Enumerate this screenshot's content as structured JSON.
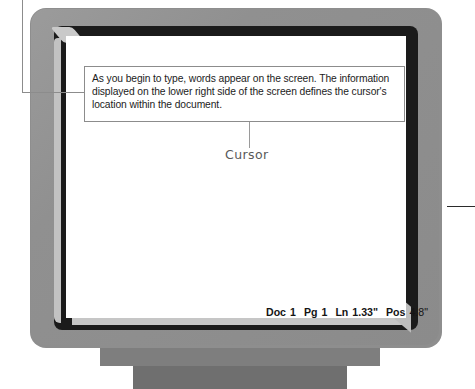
{
  "scene": {
    "title": "CRT monitor illustration with screen callout"
  },
  "callout": {
    "caption": "As you begin to type, words appear on the screen. The information displayed on the lower right side of the screen defines the cursor's location within the document.",
    "leader_left_label": "leader-line-to-caption",
    "leader_right_label": "leader-line-right"
  },
  "screen": {
    "cursor_label": "Cursor",
    "cursor_glyph": "underline-cursor"
  },
  "status_bar": {
    "doc_label": "Doc",
    "doc_value": "1",
    "pg_label": "Pg",
    "pg_value": "1",
    "ln_label": "Ln",
    "ln_value": "1.33\"",
    "pos_label": "Pos",
    "pos_value": "4.8\"",
    "full_text": "Doc 1  Pg 1  Ln 1.33\"  Pos 4.8\""
  },
  "colors": {
    "casing": "#8e8e8e",
    "bezel": "#1b1b1b",
    "screen": "#ffffff",
    "chamfer": "#c4c4c4",
    "stand_neck": "#7e7e7e",
    "stand_base": "#6f6f6f",
    "caption_border": "#8c8c8c",
    "text": "#1c1c1c",
    "cursor_label": "#595959"
  }
}
